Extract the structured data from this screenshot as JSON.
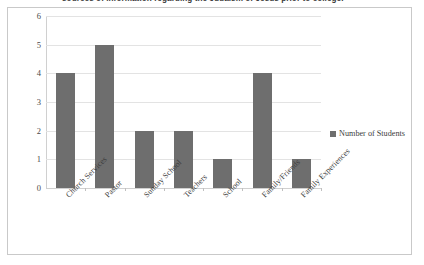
{
  "caption": {
    "text": "sources of information regarding the Judaism of Jesus prior to college."
  },
  "colors": {
    "bar": "#6e6e6e",
    "gridline": "#e3e3e3",
    "axis": "#d0d0d0",
    "frame_border": "#c9c9c9",
    "text": "#3d3d3d"
  },
  "legend": {
    "position": "right",
    "entries": [
      {
        "label": "Number of Students",
        "color": "#6e6e6e"
      }
    ]
  },
  "chart_data": {
    "type": "bar",
    "title": "",
    "xlabel": "",
    "ylabel": "",
    "ylim": [
      0,
      6
    ],
    "yticks": [
      0,
      1,
      2,
      3,
      4,
      5,
      6
    ],
    "grid": true,
    "legend_position": "right",
    "categories": [
      "Church Services",
      "Pastor",
      "Sunday School",
      "Teachers",
      "School",
      "Family/Friends",
      "Family Experiences"
    ],
    "series": [
      {
        "name": "Number of Students",
        "color": "#6e6e6e",
        "values": [
          4,
          5,
          2,
          2,
          1,
          4,
          1
        ]
      }
    ]
  }
}
